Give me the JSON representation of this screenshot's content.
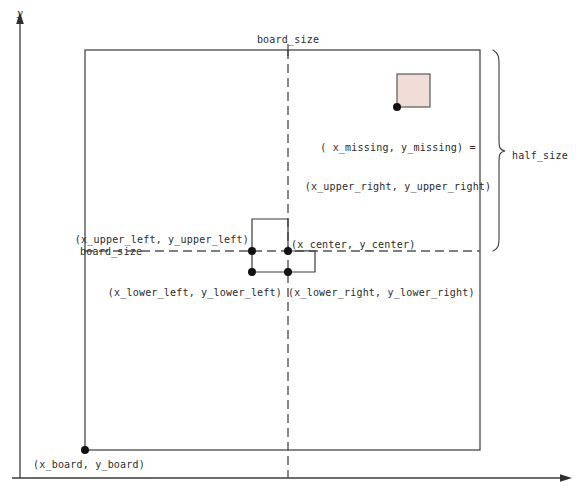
{
  "figure": {
    "kind": "geometry-diagram",
    "background": "#ffffff",
    "line_color": "#3a3a3a",
    "dash_color": "#555555",
    "tile_fill": "#f0ddd8",
    "tile_stroke": "#4a4a4a",
    "text_color": "#2b2b2b"
  },
  "axes": {
    "y_label": "y",
    "x_label": ""
  },
  "labels": {
    "board_size_top": "board_size",
    "board_size_left": "board_size",
    "half_size": "half_size",
    "board_origin": "(x_board, y_board)",
    "upper_left": "(x_upper_left, y_upper_left)",
    "lower_left": "(x_lower_left, y_lower_left)",
    "center": "(x_center, y_center)",
    "lower_right": "(x_lower_right, y_lower_right)",
    "missing_line1": "( x_missing, y_missing) =",
    "missing_line2": "(x_upper_right, y_upper_right)"
  },
  "geometry": {
    "board": {
      "x": 85,
      "y": 50,
      "width": 395,
      "height": 400
    },
    "center_x": 288,
    "center_y": 251,
    "tile": {
      "x": 397,
      "y": 74,
      "width": 33,
      "height": 33
    },
    "polygon_points": "252,219 288,219 288,251 315,251 315,272 252,272",
    "dots": [
      {
        "name": "board-origin-dot",
        "x": 85,
        "y": 450
      },
      {
        "name": "upper-left-dot",
        "x": 252,
        "y": 251
      },
      {
        "name": "center-dot",
        "x": 288,
        "y": 251
      },
      {
        "name": "lower-left-dot",
        "x": 252,
        "y": 272
      },
      {
        "name": "lower-right-dot",
        "x": 288,
        "y": 272
      },
      {
        "name": "missing-tile-dot",
        "x": 397,
        "y": 107
      }
    ],
    "brace": {
      "x": 492,
      "y_top": 50,
      "y_bottom": 251,
      "label_x": 510,
      "label_y": 155
    }
  }
}
